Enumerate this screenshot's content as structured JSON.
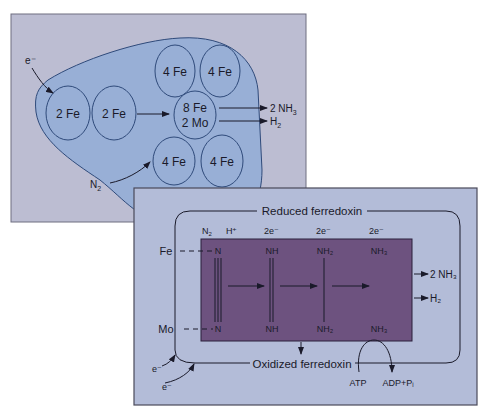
{
  "top_panel": {
    "electron_label": "e⁻",
    "n2_label": "N",
    "n2_sub": "2",
    "clusters": {
      "fe2_a": "2 Fe",
      "fe2_b": "2 Fe",
      "fe4_tl": "4 Fe",
      "fe4_tr": "4 Fe",
      "fe4_bl": "4 Fe",
      "fe4_br": "4 Fe",
      "center_line1": "8 Fe",
      "center_line2": "2 Mo"
    },
    "products": {
      "nh3": "2 NH",
      "nh3_sub": "3",
      "h2": "H",
      "h2_sub": "2"
    }
  },
  "bottom_panel": {
    "reduced": "Reduced ferredoxin",
    "oxidized": "Oxidized ferredoxin",
    "fe": "Fe",
    "mo": "Mo",
    "inputs": {
      "n2": "N",
      "n2_sub": "2",
      "h": "H⁺",
      "e1": "2e⁻",
      "e2": "2e⁻",
      "e3": "2e⁻"
    },
    "top_row": [
      "N",
      "NH",
      "NH₂",
      "NH₃"
    ],
    "bottom_row": [
      "N",
      "NH",
      "NH₂",
      "NH₃"
    ],
    "products": {
      "nh3": "2 NH₃",
      "h2": "H₂"
    },
    "electron": "e⁻",
    "atp": "ATP",
    "adp": "ADP+Pᵢ"
  },
  "colors": {
    "panel_bg": "#b6bad3",
    "protein": "#9ab0d8",
    "purple": "#6d527f",
    "line": "#2a3560"
  }
}
